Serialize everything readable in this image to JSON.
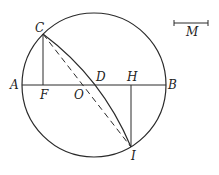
{
  "diagram": {
    "labels": {
      "A": "A",
      "B": "B",
      "C": "C",
      "D": "D",
      "F": "F",
      "H": "H",
      "I": "I",
      "O": "O",
      "M": "M"
    },
    "colors": {
      "stroke": "#2a2a2a",
      "background": "#ffffff"
    }
  }
}
